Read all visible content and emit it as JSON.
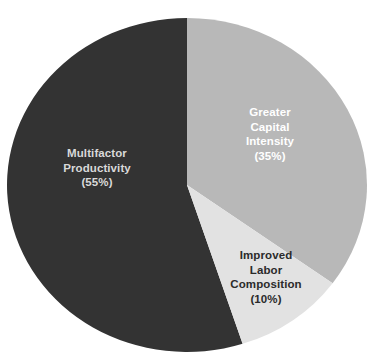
{
  "chart_data": {
    "type": "pie",
    "title": "",
    "subtitle": "",
    "xlabel": "",
    "ylabel": "",
    "legend_position": "none",
    "grid": false,
    "labels_inside_slices": true,
    "total": 100,
    "units": "percent",
    "categories": [
      "Greater Capital Intensity",
      "Improved Labor Composition",
      "Multifactor Productivity"
    ],
    "values": [
      35,
      10,
      55
    ],
    "colors": [
      "#b8b8b8",
      "#e2e2e2",
      "#333333"
    ],
    "start_angle_deg": 0,
    "direction": "clockwise",
    "slices": [
      {
        "name": "Greater Capital Intensity",
        "value": 35,
        "percent_text": "(35%)",
        "color": "#b8b8b8",
        "label_color": "#ffffff",
        "label_lines": [
          "Greater",
          "Capital",
          "Intensity",
          "(35%)"
        ],
        "start_deg": 0,
        "end_deg": 126
      },
      {
        "name": "Improved Labor Composition",
        "value": 10,
        "percent_text": "(10%)",
        "color": "#e2e2e2",
        "label_color": "#2b2b2b",
        "label_lines": [
          "Improved",
          "Labor",
          "Composition",
          "(10%)"
        ],
        "start_deg": 126,
        "end_deg": 162
      },
      {
        "name": "Multifactor Productivity",
        "value": 55,
        "percent_text": "(55%)",
        "color": "#333333",
        "label_color": "#d9d9d9",
        "label_lines": [
          "Multifactor",
          "Productivity",
          "(55%)"
        ],
        "start_deg": 162,
        "end_deg": 360
      }
    ]
  },
  "labels": {
    "multifactor": "Multifactor\nProductivity\n(55%)",
    "capital": "Greater\nCapital\nIntensity\n(35%)",
    "labor": "Improved\nLabor\nComposition\n(10%)"
  },
  "canvas": {
    "background": "#ffffff",
    "center_x": 187,
    "center_y": 185,
    "radius_x": 180,
    "radius_y": 167
  }
}
